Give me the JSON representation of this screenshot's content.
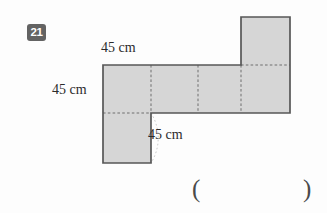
{
  "problem": {
    "number": "21"
  },
  "figure": {
    "name": "cube-net-diagram",
    "type": "net",
    "unit_length_label": "45 cm",
    "square_count": 6,
    "fill_color": "#d6d6d6",
    "stroke_color": "#575757",
    "dashed_color": "#6b6b6b",
    "arc_color": "#b0b0b0",
    "squares": [
      {
        "name": "top-right-square",
        "col": 3,
        "row": 0
      },
      {
        "name": "row-square-1",
        "col": 0,
        "row": 1
      },
      {
        "name": "row-square-2",
        "col": 1,
        "row": 1
      },
      {
        "name": "row-square-3",
        "col": 2,
        "row": 1
      },
      {
        "name": "row-square-4",
        "col": 3,
        "row": 1
      },
      {
        "name": "bottom-left-square",
        "col": 0,
        "row": 2
      }
    ]
  },
  "labels": {
    "top": "45 cm",
    "left": "45 cm",
    "bottom": "45 cm"
  },
  "answer_blank": {
    "open": "(",
    "close": ")"
  }
}
